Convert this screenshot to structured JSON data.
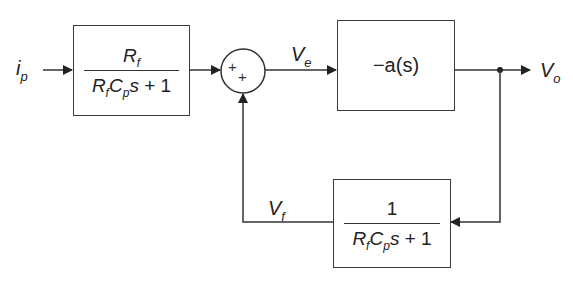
{
  "diagram": {
    "type": "block-diagram",
    "signals": {
      "input": {
        "base": "i",
        "sub": "p"
      },
      "error": {
        "base": "V",
        "sub": "e"
      },
      "output": {
        "base": "V",
        "sub": "o"
      },
      "feedback": {
        "base": "V",
        "sub": "f"
      }
    },
    "forward_block": {
      "numerator": {
        "base": "R",
        "sub": "f"
      },
      "denominator": {
        "r": "R",
        "r_sub": "f",
        "c": "C",
        "c_sub": "p",
        "s": "s",
        "rest": " + 1"
      }
    },
    "amplifier_block": {
      "label": "−a(s)"
    },
    "feedback_block": {
      "numerator": "1",
      "denominator": {
        "r": "R",
        "r_sub": "f",
        "c": "C",
        "c_sub": "p",
        "s": "s",
        "rest": " + 1"
      }
    },
    "summing_junction": {
      "signs": [
        "+",
        "+"
      ]
    },
    "colors": {
      "line": "#333333",
      "background": "#ffffff"
    }
  }
}
